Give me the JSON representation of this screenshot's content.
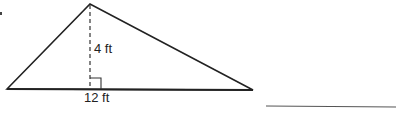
{
  "diagram": {
    "shape": "triangle",
    "height_label": "4 ft",
    "base_label": "12 ft",
    "right_angle_marker": true,
    "answer_line": ""
  },
  "colors": {
    "stroke": "#222222",
    "background": "#ffffff",
    "answer_line": "#555555"
  }
}
